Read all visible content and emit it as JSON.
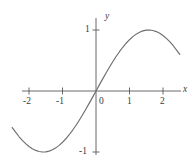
{
  "chart_data": {
    "type": "line",
    "title": "",
    "subtitle": "",
    "xlabel": "x",
    "ylabel": "y",
    "xlim": [
      -2.6,
      2.7
    ],
    "ylim": [
      -1.25,
      1.25
    ],
    "grid": false,
    "legend": false,
    "legend_position": "none",
    "x_tick_labels": [
      "-2",
      "-1",
      "0",
      "1",
      "2"
    ],
    "x_ticks": [
      -2,
      -1,
      0,
      1,
      2
    ],
    "y_tick_labels": [
      "1",
      "-1"
    ],
    "y_ticks": [
      1,
      -1
    ],
    "annotations": [],
    "series": [
      {
        "name": "y = sin(x)",
        "color": "#6e6e72",
        "x": [
          -2.5,
          -2.4,
          -2.3,
          -2.2,
          -2.1,
          -2.0,
          -1.9,
          -1.8,
          -1.7,
          -1.6,
          -1.5,
          -1.4,
          -1.3,
          -1.2,
          -1.1,
          -1.0,
          -0.9,
          -0.8,
          -0.7,
          -0.6,
          -0.5,
          -0.4,
          -0.3,
          -0.2,
          -0.1,
          0.0,
          0.1,
          0.2,
          0.3,
          0.4,
          0.5,
          0.6,
          0.7,
          0.8,
          0.9,
          1.0,
          1.1,
          1.2,
          1.3,
          1.4,
          1.5,
          1.6,
          1.7,
          1.8,
          1.9,
          2.0,
          2.1,
          2.2,
          2.3,
          2.4,
          2.5
        ],
        "values": [
          -0.599,
          -0.675,
          -0.746,
          -0.808,
          -0.863,
          -0.909,
          -0.946,
          -0.974,
          -0.992,
          -1.0,
          -0.997,
          -0.985,
          -0.964,
          -0.932,
          -0.891,
          -0.841,
          -0.783,
          -0.717,
          -0.644,
          -0.565,
          -0.479,
          -0.389,
          -0.296,
          -0.199,
          -0.1,
          0.0,
          0.1,
          0.199,
          0.296,
          0.389,
          0.479,
          0.565,
          0.644,
          0.717,
          0.783,
          0.841,
          0.891,
          0.932,
          0.964,
          0.985,
          0.997,
          1.0,
          0.992,
          0.974,
          0.946,
          0.909,
          0.863,
          0.808,
          0.746,
          0.675,
          0.599
        ]
      }
    ],
    "colors": {
      "curve": "#6e6e72",
      "axis": "#595959",
      "text": "#3b3b3b",
      "background": "#ffffff"
    }
  },
  "labels": {
    "x_axis": "x",
    "y_axis": "y",
    "x_neg2": "-2",
    "x_neg1": "-1",
    "x_zero": "0",
    "x_pos1": "1",
    "x_pos2": "2",
    "y_pos1": "1",
    "y_neg1": "-1"
  }
}
